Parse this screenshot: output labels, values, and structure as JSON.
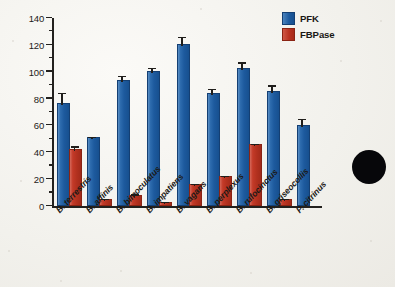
{
  "chart_data": {
    "type": "bar",
    "title": "",
    "xlabel": "",
    "ylabel": "Enzyme activity (units g⁻¹)",
    "ylim": [
      0,
      140
    ],
    "ytick_labels": [
      "0",
      "20",
      "40",
      "60",
      "80",
      "100",
      "120",
      "140"
    ],
    "ytick_values": [
      0,
      20,
      40,
      60,
      80,
      100,
      120,
      140
    ],
    "yminor_values": [
      10,
      30,
      50,
      70,
      90,
      110,
      130
    ],
    "grid": false,
    "legend_position": "top-right",
    "categories": [
      "B. terrestris",
      "B. affinis",
      "B. bimoculatus",
      "B. impatiens",
      "B. vagans",
      "B. perplexus",
      "B. rufocinctus",
      "B. griseocollis",
      "P. citrinus"
    ],
    "series": [
      {
        "name": "PFK",
        "color": "#1d5a9e",
        "values": [
          75,
          50,
          92,
          99,
          119,
          83,
          101,
          84,
          59
        ],
        "errors": [
          8.5,
          0.8,
          4.0,
          3.0,
          6.0,
          3.5,
          5.0,
          5.0,
          5.0
        ]
      },
      {
        "name": "FBPase",
        "color": "#b93322",
        "values": [
          41,
          4,
          7,
          1.5,
          15,
          21,
          44.5,
          4,
          null
        ],
        "errors": [
          2.5,
          0.6,
          0.8,
          0.4,
          0.8,
          0.8,
          0.8,
          0.6,
          null
        ]
      }
    ]
  },
  "legend": {
    "items": [
      {
        "label": "PFK",
        "color": "#1d5a9e"
      },
      {
        "label": "FBPase",
        "color": "#b93322"
      }
    ]
  },
  "annotations": {
    "black_dot": "solid-black-circle-marker"
  },
  "colors": {
    "pfk": "#1d5a9e",
    "fbpase": "#b93322",
    "axis": "#23211e",
    "background": "#f3f2ee"
  }
}
